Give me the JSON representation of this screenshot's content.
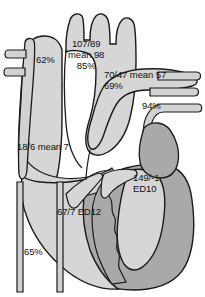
{
  "figure": {
    "background_color": "#ffffff"
  },
  "palette": {
    "chamber_light": "#d6d6d6",
    "myocardium_dark": "#a9a9a9",
    "vessel_light": "#d2d2d2",
    "outline": "#1a1a1a",
    "text": "#111111"
  },
  "structures": [
    {
      "name": "aorta-ascending-arch",
      "fill": "#d6d6d6"
    },
    {
      "name": "aortic-arch-branch-vessels",
      "fill": "#d6d6d6"
    },
    {
      "name": "superior-vena-cava",
      "fill": "#d2d2d2"
    },
    {
      "name": "svc-tributary-branches",
      "fill": "#d2d2d2"
    },
    {
      "name": "right-atrium",
      "fill": "#d6d6d6"
    },
    {
      "name": "inferior-vena-cava",
      "fill": "#d2d2d2"
    },
    {
      "name": "pulmonary-artery-trunk",
      "fill": "#d6d6d6"
    },
    {
      "name": "pulmonary-artery-branches",
      "fill": "#d2d2d2"
    },
    {
      "name": "pulmonary-capillary-wedge-vessel",
      "fill": "#d2d2d2"
    },
    {
      "name": "right-ventricle",
      "fill": "#d6d6d6"
    },
    {
      "name": "left-ventricle-myocardium",
      "fill": "#a9a9a9"
    },
    {
      "name": "left-ventricle-cavity",
      "fill": "#d6d6d6"
    },
    {
      "name": "interventricular-septum",
      "fill": "#a9a9a9"
    },
    {
      "name": "tricuspid-valve-leaflets",
      "fill": "#d6d6d6"
    }
  ],
  "measurements": [
    {
      "id": "svc-saturation",
      "name": "svc-saturation-label",
      "lines": [
        "62%"
      ],
      "site": "superior vena cava",
      "kind": "oxygen saturation",
      "x": 36,
      "y": 54,
      "align": "left"
    },
    {
      "id": "aorta",
      "name": "aortic-pressure-label",
      "lines": [
        "107/89",
        "mean 98",
        "85%"
      ],
      "site": "aorta",
      "kind": "pressure and saturation",
      "x": 68,
      "y": 38,
      "align": "center"
    },
    {
      "id": "pulmonary-artery",
      "name": "pulmonary-artery-pressure-label",
      "lines": [
        "70/47 mean 57",
        "69%"
      ],
      "site": "pulmonary artery",
      "kind": "pressure and saturation",
      "x": 104,
      "y": 69,
      "align": "left"
    },
    {
      "id": "pulmonary-vein-saturation",
      "name": "pulmonary-vein-saturation-label",
      "lines": [
        "94%"
      ],
      "site": "pulmonary vein",
      "kind": "oxygen saturation",
      "x": 142,
      "y": 100,
      "align": "left"
    },
    {
      "id": "right-atrium",
      "name": "right-atrial-pressure-label",
      "lines": [
        "18/6 mean 7"
      ],
      "site": "right atrium",
      "kind": "pressure",
      "x": 17,
      "y": 141,
      "align": "left"
    },
    {
      "id": "left-ventricle",
      "name": "left-ventricular-pressure-label",
      "lines": [
        "149/-1",
        "ED10"
      ],
      "site": "left ventricle",
      "kind": "pressure and end-diastolic pressure",
      "x": 133,
      "y": 172,
      "align": "left"
    },
    {
      "id": "right-ventricle",
      "name": "right-ventricular-pressure-label",
      "lines": [
        "67/7 ED12"
      ],
      "site": "right ventricle",
      "kind": "pressure and end-diastolic pressure",
      "x": 57,
      "y": 206,
      "align": "left"
    },
    {
      "id": "ivc-saturation",
      "name": "ivc-saturation-label",
      "lines": [
        "65%"
      ],
      "site": "inferior vena cava",
      "kind": "oxygen saturation",
      "x": 24,
      "y": 246,
      "align": "left"
    }
  ]
}
